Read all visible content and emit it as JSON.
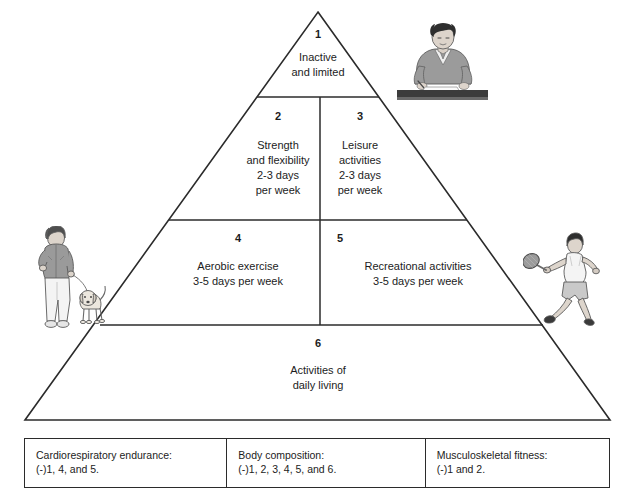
{
  "figure": {
    "type": "physical-activity-pyramid",
    "shape": "triangle",
    "apex": {
      "x": 318,
      "y": 12
    },
    "base_left": {
      "x": 25,
      "y": 420
    },
    "base_right": {
      "x": 610,
      "y": 420
    },
    "tier_divider_y": [
      97,
      220,
      325
    ],
    "center_line_x": 320,
    "line_color": "#2b2b2b",
    "background_color": "#ffffff",
    "text_color": "#1c1c1c"
  },
  "pyramid": {
    "tiers": [
      {
        "level": 1,
        "position": "apex",
        "cells": [
          {
            "number": "1",
            "lines": [
              "Inactive",
              "and limited"
            ]
          }
        ]
      },
      {
        "level": 2,
        "position": "upper-middle",
        "cells": [
          {
            "number": "2",
            "lines": [
              "Strength",
              "and flexibility",
              "2-3 days",
              "per week"
            ]
          },
          {
            "number": "3",
            "lines": [
              "Leisure",
              "activities",
              "2-3 days",
              "per week"
            ]
          }
        ]
      },
      {
        "level": 3,
        "position": "lower-middle",
        "cells": [
          {
            "number": "4",
            "lines": [
              "Aerobic exercise",
              "3-5 days per week"
            ]
          },
          {
            "number": "5",
            "lines": [
              "Recreational activities",
              "3-5 days per week"
            ]
          }
        ]
      },
      {
        "level": 4,
        "position": "base",
        "cells": [
          {
            "number": "6",
            "lines": [
              "Activities of",
              "daily living"
            ]
          }
        ]
      }
    ]
  },
  "legend": {
    "cells": [
      {
        "title": "Cardiorespiratory endurance:",
        "detail": "(-)1, 4, and 5."
      },
      {
        "title": "Body composition:",
        "detail": "(-)1, 2, 3, 4, 5, and 6."
      },
      {
        "title": "Musculoskeletal fitness:",
        "detail": "(-)1 and 2."
      }
    ]
  },
  "illustrations": [
    {
      "name": "person-seated-at-desk-illustration",
      "description": "Person with dark hair in a grey sweater seated at a dark desk writing",
      "placement": "top-right, beside tier 1",
      "colors": {
        "hair": "#2e2e2e",
        "clothing": "#8e8e8e",
        "skin": "#d8cfc6",
        "desk": "#3c3c3c"
      }
    },
    {
      "name": "person-walking-dog-illustration",
      "description": "Person in a grey jacket and light trousers walking a dog on a leash",
      "placement": "left side, beside tier 3",
      "colors": {
        "hair": "#4a4a4a",
        "clothing": "#9a9a9a",
        "trousers": "#efefef",
        "dog": "#e6e2da"
      }
    },
    {
      "name": "tennis-player-illustration",
      "description": "Tennis player lunging forward swinging a racket",
      "placement": "right side, beside tier 3",
      "colors": {
        "hair": "#2e2e2e",
        "shirt": "#f2f2f2",
        "shorts": "#c9c9c9",
        "racket": "#8a8a8a",
        "shoes": "#3a3a3a"
      }
    }
  ]
}
